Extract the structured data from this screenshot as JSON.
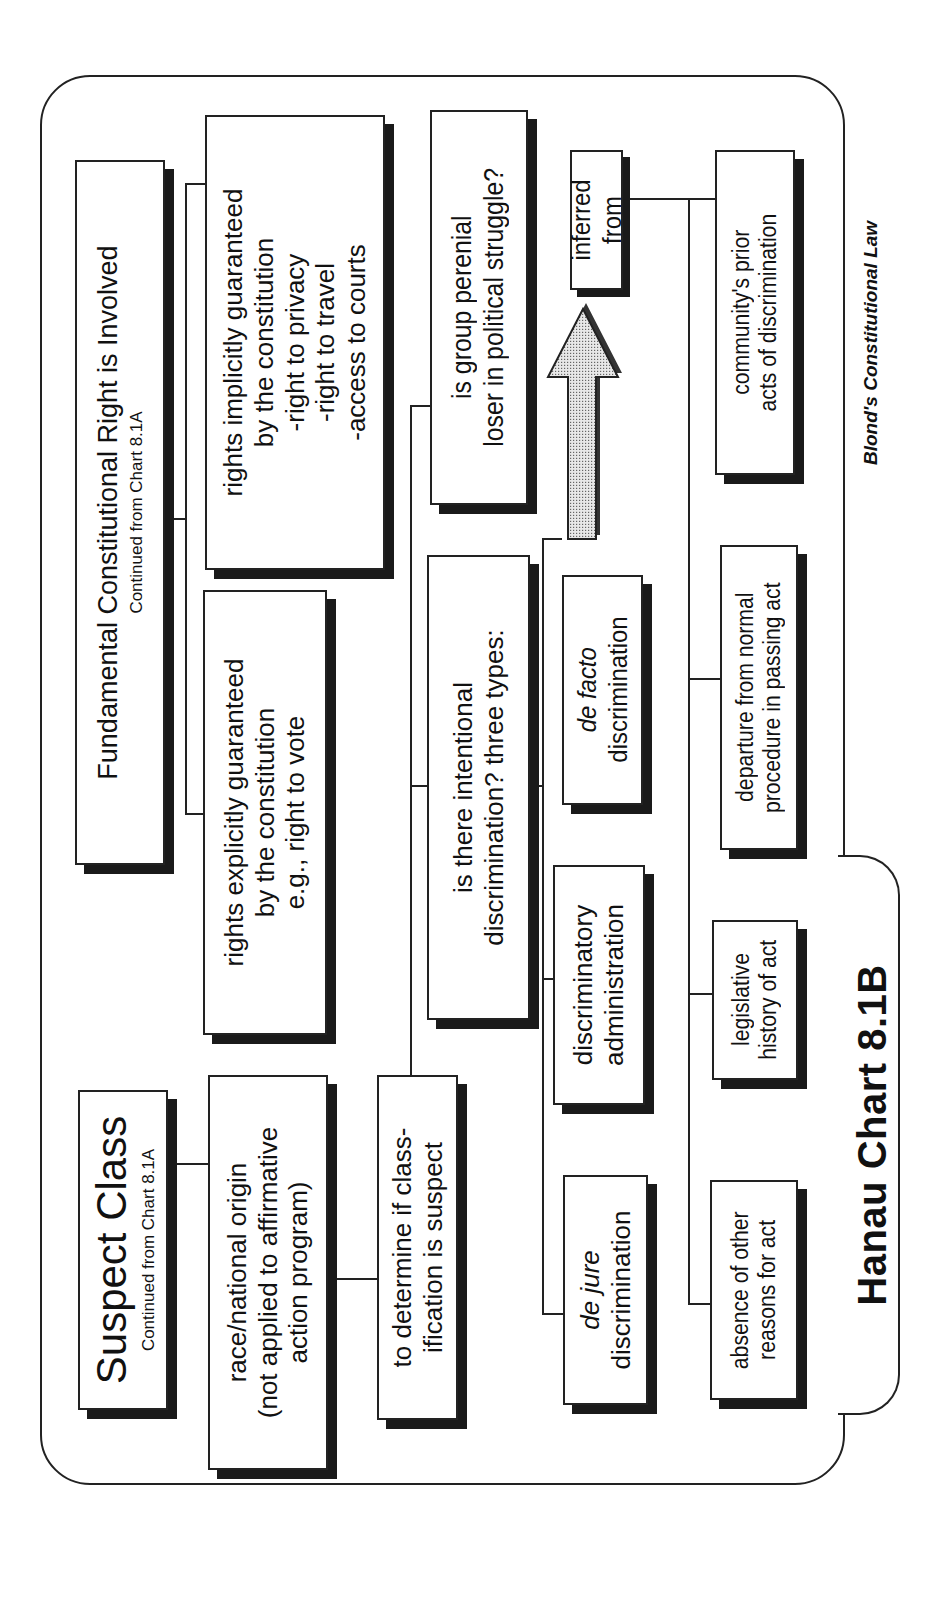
{
  "chart_title": "Hanau Chart 8.1B",
  "credit": "Blond's Constitutional Law",
  "suspect_class": {
    "title": "Suspect Class",
    "subtitle": "Continued from Chart 8.1A",
    "race_origin": {
      "lines": [
        "race/national origin",
        "(not applied to affirmative",
        "action program)"
      ]
    },
    "determine": {
      "lines": [
        "to determine if class-",
        "ification is suspect"
      ]
    },
    "intentional": {
      "lines": [
        "is there intentional",
        "discrimination? three types:"
      ],
      "types": [
        {
          "prefix": "de jure",
          "suffix": "discrimination"
        },
        {
          "prefix": "",
          "line1": "discriminatory",
          "suffix": "administration"
        },
        {
          "prefix": "de facto",
          "suffix": "discrimination"
        }
      ]
    },
    "perennial_loser": {
      "lines": [
        "is group perenial",
        "loser in political struggle?"
      ]
    },
    "inferred_from": {
      "label": "inferred from",
      "arrow_icon": "up-arrow-icon",
      "sources": [
        {
          "lines": [
            "absence of other",
            "reasons for act"
          ]
        },
        {
          "lines": [
            "legislative",
            "history of act"
          ]
        },
        {
          "lines": [
            "departure from normal",
            "procedure in passing act"
          ]
        },
        {
          "lines": [
            "community's prior",
            "acts of discrimination"
          ]
        }
      ]
    }
  },
  "fundamental_right": {
    "title": "Fundamental Constitutional Right is Involved",
    "subtitle": "Continued from Chart 8.1A",
    "explicit": {
      "lines": [
        "rights explicitly guaranteed",
        "by the constitution",
        "e.g., right to vote"
      ]
    },
    "implicit": {
      "lines": [
        "rights implicitly guaranteed",
        "by the constitution",
        "-right to privacy",
        "-right to travel",
        "-access to courts"
      ]
    }
  }
}
